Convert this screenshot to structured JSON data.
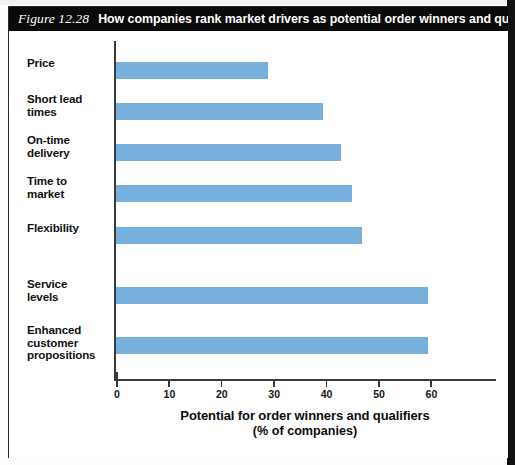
{
  "figure": {
    "number": "Figure 12.28",
    "caption": "How companies rank market drivers as potential order winners and qualifiers"
  },
  "axis_title": {
    "line1": "Potential for order winners and qualifiers",
    "line2": "(% of companies)"
  },
  "colors": {
    "bar": "#77AFDD",
    "title_bar_bg": "#0A0A0A",
    "title_bar_text": "#FFFFFF",
    "axis": "#3A3A3A",
    "panel_bg": "#FFFFFF"
  },
  "chart_data": {
    "type": "bar",
    "orientation": "horizontal",
    "title": "How companies rank market drivers as potential order winners and qualifiers",
    "xlabel": "Potential for order winners and qualifiers (% of companies)",
    "ylabel": "",
    "xlim": [
      0,
      72
    ],
    "xticks": [
      0,
      10,
      20,
      30,
      40,
      50,
      60
    ],
    "xtick_labels": [
      "0",
      "10",
      "20",
      "30",
      "40",
      "50",
      "60"
    ],
    "grid": false,
    "legend": "none",
    "categories": [
      "Price",
      "Short lead times",
      "On-time delivery",
      "Time to market",
      "Flexibility",
      "Service levels",
      "Enhanced customer propositions"
    ],
    "category_label_lines": [
      [
        "Price"
      ],
      [
        "Short lead",
        "times"
      ],
      [
        "On-time",
        "delivery"
      ],
      [
        "Time to",
        "market"
      ],
      [
        "Flexibility"
      ],
      [
        "Service",
        "levels"
      ],
      [
        "Enhanced",
        "customer",
        "propositions"
      ]
    ],
    "values": [
      29,
      39.5,
      43,
      45,
      47,
      59.5,
      59.5
    ]
  }
}
